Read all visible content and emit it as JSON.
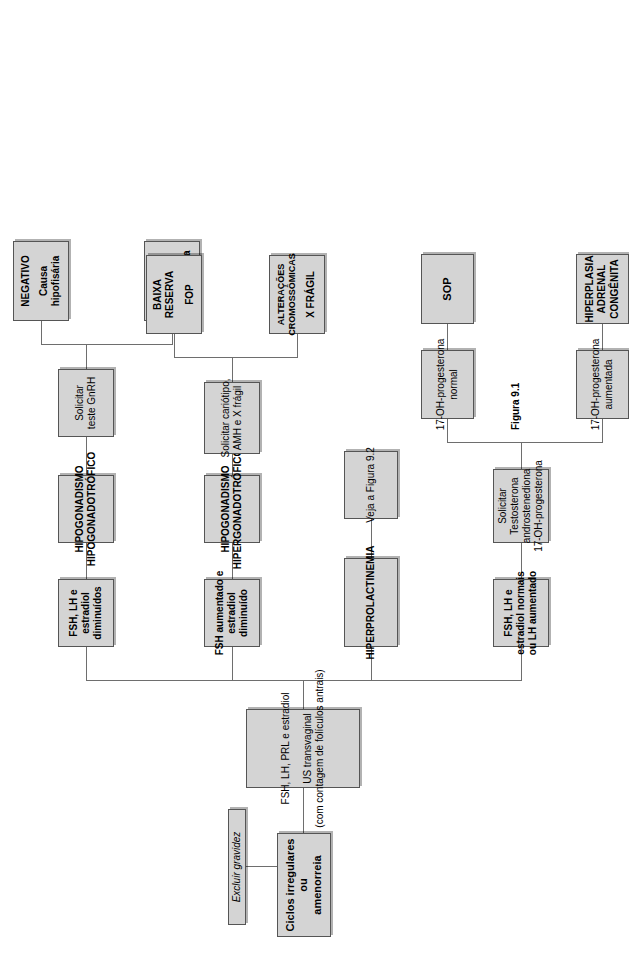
{
  "figure": {
    "caption": "Figura 9.1",
    "accent_fill": "#d4d4d4",
    "accent_border": "#555555",
    "line_color": "#6e6e6e"
  },
  "nodes": {
    "start": {
      "lines": [
        "Ciclos irregulares",
        "ou",
        "amenorreia"
      ]
    },
    "exclude_pregnancy": {
      "lines": [
        "Excluir gravidez"
      ]
    },
    "workup": {
      "lines": [
        "FSH, LH, PRL e estradiol",
        "US transvaginal",
        "(com contagem de folículos antrais)"
      ]
    },
    "branch_hypo": {
      "lines": [
        "FSH, LH e",
        "estradiol",
        "diminuídos"
      ]
    },
    "dx_hypogonadotrophic": {
      "lines": [
        "HIPOGONADISMO",
        "HIPOGONADOTRÓFICO"
      ]
    },
    "test_gnrh": {
      "lines": [
        "Solicitar",
        "teste GnRH"
      ]
    },
    "gnrh_positive": {
      "lines": [
        "POSITIVO",
        "Causa",
        "hipotalâmica"
      ]
    },
    "gnrh_negative": {
      "lines": [
        "NEGATIVO",
        "Causa",
        "hipofisária"
      ]
    },
    "branch_hyper": {
      "lines": [
        "FSH aumentado e",
        "estradiol",
        "diminuído"
      ]
    },
    "dx_hypergonadotrophic": {
      "lines": [
        "HIPOGONADISMO",
        "HIPERGONADOTRÓFICO"
      ]
    },
    "test_karyotype": {
      "lines": [
        "Solicitar cariótipo,",
        "AMH e X frágil"
      ]
    },
    "result_chromosomal": {
      "lines": [
        "ALTERAÇÕES",
        "CROMOSSÔMICAS",
        "X FRÁGIL"
      ]
    },
    "result_low_reserve": {
      "lines": [
        "BAIXA",
        "RESERVA",
        "FOP"
      ]
    },
    "branch_prolactin": {
      "lines": [
        "HIPERPROLACTINEMIA"
      ]
    },
    "see_figure_92": {
      "lines": [
        "Veja a Figura 9.2"
      ]
    },
    "branch_normal": {
      "lines": [
        "FSH, LH e",
        "estradiol normais",
        "ou LH aumentado"
      ]
    },
    "test_androgens": {
      "lines": [
        "Solicitar",
        "Testosterona",
        "androstenediona",
        "17-OH-progesterona"
      ]
    },
    "ohp_increased": {
      "lines": [
        "17-OH-progesterona",
        "aumentada"
      ]
    },
    "ohp_normal": {
      "lines": [
        "17-OH-progesterona",
        "normal"
      ]
    },
    "dx_cah": {
      "lines": [
        "HIPERPLASIA",
        "ADRENAL",
        "CONGÊNITA"
      ]
    },
    "dx_sop": {
      "lines": [
        "SOP"
      ]
    }
  }
}
